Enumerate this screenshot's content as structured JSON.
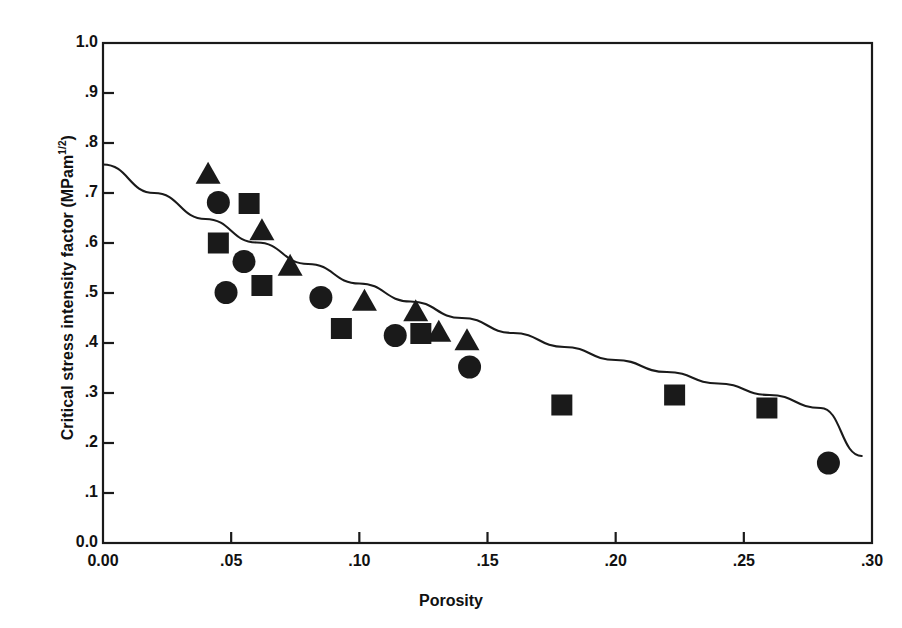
{
  "chart_data": {
    "type": "scatter",
    "title": "",
    "xlabel": "Porosity",
    "ylabel": "Critical stress intensity factor   (MPam 1/2)",
    "ylabel_main": "Critical stress intensity factor   (MPam",
    "ylabel_exponent": "1/2",
    "ylabel_suffix": ")",
    "xlim": [
      0.0,
      0.3
    ],
    "ylim": [
      0.0,
      1.0
    ],
    "grid": false,
    "legend": "none",
    "marker_color": "#1a1a1a",
    "line_color": "#1a1a1a",
    "background": "#ffffff",
    "xticks": [
      0.0,
      0.05,
      0.1,
      0.15,
      0.2,
      0.25,
      0.3
    ],
    "xticklabels": [
      "0.00",
      ".05",
      ".10",
      ".15",
      ".20",
      ".25",
      ".30"
    ],
    "yticks": [
      0.0,
      0.1,
      0.2,
      0.3,
      0.4,
      0.5,
      0.6,
      0.7,
      0.8,
      0.9,
      1.0
    ],
    "yticklabels": [
      "0.0",
      ".1",
      ".2",
      ".3",
      ".4",
      ".5",
      ".6",
      ".7",
      ".8",
      ".9",
      "1.0"
    ],
    "series": [
      {
        "name": "triangles",
        "marker": "triangle",
        "points": [
          [
            0.041,
            0.735
          ],
          [
            0.062,
            0.622
          ],
          [
            0.073,
            0.551
          ],
          [
            0.102,
            0.481
          ],
          [
            0.122,
            0.46
          ],
          [
            0.131,
            0.419
          ],
          [
            0.142,
            0.402
          ]
        ]
      },
      {
        "name": "circles",
        "marker": "circle",
        "points": [
          [
            0.045,
            0.681
          ],
          [
            0.055,
            0.563
          ],
          [
            0.048,
            0.501
          ],
          [
            0.085,
            0.491
          ],
          [
            0.114,
            0.415
          ],
          [
            0.143,
            0.352
          ],
          [
            0.283,
            0.16
          ]
        ]
      },
      {
        "name": "squares",
        "marker": "square",
        "points": [
          [
            0.045,
            0.6
          ],
          [
            0.057,
            0.679
          ],
          [
            0.062,
            0.515
          ],
          [
            0.093,
            0.429
          ],
          [
            0.124,
            0.419
          ],
          [
            0.179,
            0.276
          ],
          [
            0.223,
            0.296
          ],
          [
            0.259,
            0.27
          ]
        ]
      }
    ],
    "fit_curve": {
      "name": "fitted-trend-line",
      "points": [
        [
          0.0,
          0.757
        ],
        [
          0.02,
          0.7
        ],
        [
          0.04,
          0.648
        ],
        [
          0.06,
          0.601
        ],
        [
          0.08,
          0.558
        ],
        [
          0.1,
          0.519
        ],
        [
          0.12,
          0.483
        ],
        [
          0.14,
          0.45
        ],
        [
          0.16,
          0.42
        ],
        [
          0.18,
          0.392
        ],
        [
          0.2,
          0.366
        ],
        [
          0.22,
          0.342
        ],
        [
          0.24,
          0.319
        ],
        [
          0.26,
          0.296
        ],
        [
          0.28,
          0.27
        ],
        [
          0.296,
          0.174
        ]
      ]
    }
  }
}
